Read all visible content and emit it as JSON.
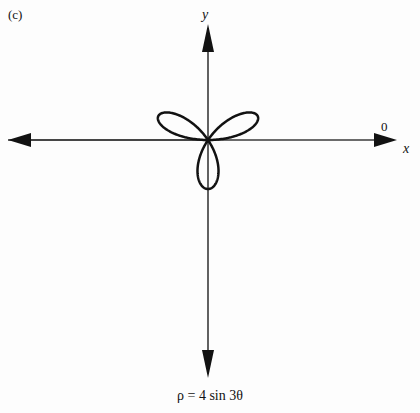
{
  "figure": {
    "panel_label": "(c)",
    "caption": "ρ = 4 sin 3θ",
    "background_color": "#fdfdfd",
    "ink_color": "#121212"
  },
  "axes": {
    "y_label": "y",
    "x_label": "x",
    "origin_label": "0",
    "x_axis": {
      "start_px": 8,
      "end_px": 397,
      "y_px": 140
    },
    "y_axis": {
      "start_px": 24,
      "end_px": 378,
      "x_px": 208
    }
  },
  "chart_data": {
    "type": "line",
    "title": "ρ = 4 sin 3θ",
    "subtitle": "(c)",
    "xlabel": "x",
    "ylabel": "y",
    "grid": false,
    "legend": "none",
    "curve_name": "three-petaled rose",
    "equation": "rho = 4 sin(3 theta)",
    "amplitude": 4,
    "petal_count": 3,
    "petal_angles_deg": [
      30,
      150,
      270
    ],
    "petal_tip_px": [
      {
        "label": "right-petal-tip",
        "x": 372,
        "y": 38
      },
      {
        "label": "left-petal-tip",
        "x": 46,
        "y": 39
      },
      {
        "label": "bottom-petal-tip",
        "x": 208,
        "y": 336
      }
    ],
    "origin_px": {
      "x": 208,
      "y": 140
    },
    "scale_px_per_unit": 49,
    "xlim": [
      -4.2,
      4.2
    ],
    "ylim": [
      -4.2,
      4.2
    ],
    "theta_range_deg": [
      0,
      360
    ],
    "samples": 721
  }
}
